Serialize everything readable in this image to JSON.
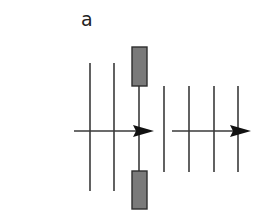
{
  "figure": {
    "panel_label": "a",
    "colors": {
      "line": "#3a3a3a",
      "arrow": "#111111",
      "block_fill": "#7a7a7a",
      "block_stroke": "#2e2e2e",
      "background": "#ffffff"
    },
    "left_group": {
      "vertical_lines": [
        {
          "x": 90,
          "y1": 63,
          "y2": 191
        },
        {
          "x": 114,
          "y1": 63,
          "y2": 191
        }
      ],
      "axis": {
        "x1": 74,
        "x2": 140,
        "y": 131
      },
      "arrowhead": {
        "tip_x": 154,
        "base_x": 133,
        "y": 131,
        "half_height": 6
      },
      "blocked_line": {
        "x": 139,
        "y1": 86,
        "y2": 171
      },
      "blocks": [
        {
          "name": "top-block",
          "x": 132,
          "y": 47,
          "width": 15,
          "height": 39
        },
        {
          "name": "bottom-block",
          "x": 132,
          "y": 171,
          "width": 15,
          "height": 38
        }
      ]
    },
    "right_group": {
      "vertical_lines": [
        {
          "x": 164,
          "y1": 86,
          "y2": 172
        },
        {
          "x": 189,
          "y1": 86,
          "y2": 172
        },
        {
          "x": 214,
          "y1": 86,
          "y2": 172
        },
        {
          "x": 238,
          "y1": 86,
          "y2": 172
        }
      ],
      "axis": {
        "x1": 172,
        "x2": 236,
        "y": 131
      },
      "arrowhead": {
        "tip_x": 251,
        "base_x": 230,
        "y": 131,
        "half_height": 6
      }
    }
  }
}
